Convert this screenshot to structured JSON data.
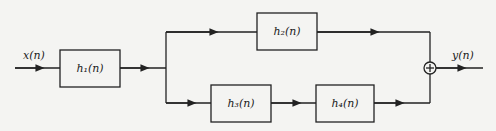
{
  "diagram": {
    "type": "block-diagram",
    "input": {
      "label": "x(n)"
    },
    "output": {
      "label": "y(n)"
    },
    "blocks": [
      {
        "id": "h1",
        "label": "h₁(n)"
      },
      {
        "id": "h2",
        "label": "h₂(n)"
      },
      {
        "id": "h3",
        "label": "h₃(n)"
      },
      {
        "id": "h4",
        "label": "h₄(n)"
      }
    ],
    "summer": {
      "symbol": "+"
    },
    "connections": [
      [
        "x(n)",
        "h1"
      ],
      [
        "h1",
        "h2"
      ],
      [
        "h1",
        "h3"
      ],
      [
        "h3",
        "h4"
      ],
      [
        "h2",
        "sum"
      ],
      [
        "h4",
        "sum"
      ],
      [
        "sum",
        "y(n)"
      ]
    ],
    "colors": {
      "line": "#222222",
      "background": "#f4f4f2"
    }
  }
}
